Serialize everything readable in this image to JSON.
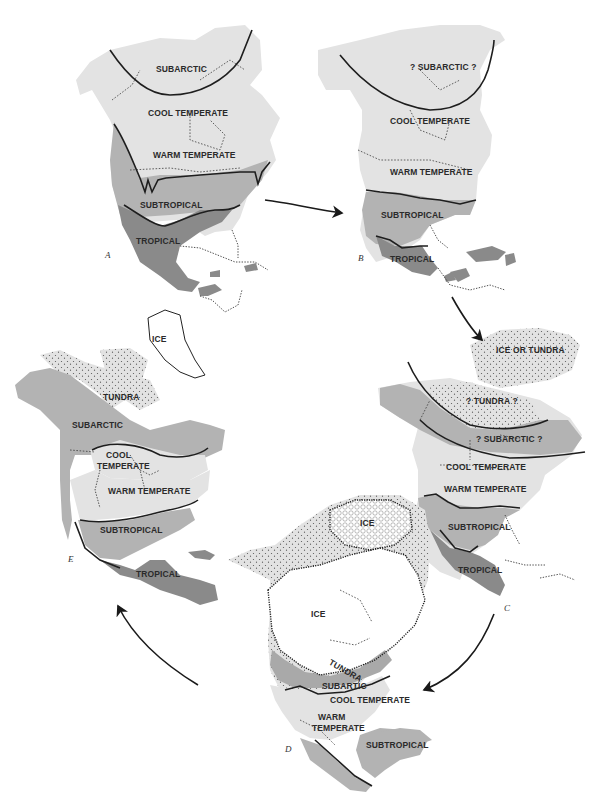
{
  "figure": {
    "type": "climate-zone-map-sequence",
    "region": "North America",
    "colors": {
      "background": "#ffffff",
      "subarctic_light": "#e3e3e3",
      "temperate_light": "#e3e3e3",
      "subtropical": "#b3b3b3",
      "tropical": "#8a8a8a",
      "subarctic_dark": "#a9a9a9",
      "tundra_stipple": "#dedede",
      "ice": "#ffffff",
      "boundary_line": "#1e1e1e"
    },
    "sequence": [
      "A",
      "B",
      "C",
      "D",
      "E"
    ],
    "panels": {
      "A": {
        "letter": "A",
        "zones": [
          "SUBARCTIC",
          "COOL TEMPERATE",
          "WARM TEMPERATE",
          "SUBTROPICAL",
          "TROPICAL"
        ]
      },
      "B": {
        "letter": "B",
        "zones": [
          "? SUBARCTIC ?",
          "COOL TEMPERATE",
          "WARM TEMPERATE",
          "SUBTROPICAL",
          "TROPICAL"
        ]
      },
      "C": {
        "letter": "C",
        "zones": [
          "ICE OR TUNDRA",
          "? TUNDRA ?",
          "? SUBARCTIC ?",
          "COOL TEMPERATE",
          "WARM TEMPERATE",
          "SUBTROPICAL",
          "TROPICAL"
        ]
      },
      "D": {
        "letter": "D",
        "zones": [
          "ICE",
          "ICE",
          "TUNDRA",
          "SUBARTIC",
          "COOL TEMPERATE",
          "WARM",
          "TEMPERATE",
          "SUBTROPICAL"
        ]
      },
      "E": {
        "letter": "E",
        "zones": [
          "ICE",
          "TUNDRA",
          "SUBARCTIC",
          "COOL",
          "TEMPERATE",
          "WARM TEMPERATE",
          "SUBTROPICAL",
          "TROPICAL"
        ]
      }
    },
    "arrows": [
      {
        "from": "A",
        "to": "B"
      },
      {
        "from": "B",
        "to": "C"
      },
      {
        "from": "C",
        "to": "D"
      },
      {
        "from": "D",
        "to": "E"
      }
    ]
  }
}
